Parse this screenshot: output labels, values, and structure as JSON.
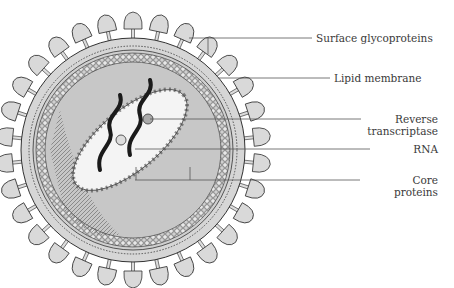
{
  "diagram": {
    "labels": [
      {
        "id": "surface-glycoproteins",
        "text": "Surface glycoproteins",
        "lines": [
          "Surface glycoproteins"
        ]
      },
      {
        "id": "lipid-membrane",
        "text": "Lipid membrane",
        "lines": [
          "Lipid membrane"
        ]
      },
      {
        "id": "reverse-transcriptase",
        "text": "Reverse transcriptase",
        "lines": [
          "Reverse",
          "transcriptase"
        ]
      },
      {
        "id": "rna",
        "text": "RNA",
        "lines": [
          "RNA"
        ]
      },
      {
        "id": "core-proteins",
        "text": "Core proteins",
        "lines": [
          "Core",
          "proteins"
        ]
      }
    ],
    "colors": {
      "outline": "#333333",
      "fill_light": "#d9d9d9",
      "fill_mid": "#bdbdbd",
      "rna": "#1a1a1a",
      "leader_line": "#555555",
      "text": "#3a3a3a"
    }
  }
}
